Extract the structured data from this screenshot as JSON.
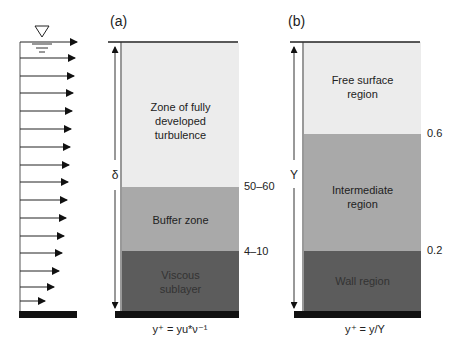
{
  "figure": {
    "velocity_profile": {
      "water_surface_symbol": "inverted-triangle",
      "arrow_count": 16
    },
    "panel_a": {
      "label": "(a)",
      "depth_symbol": "δ",
      "zones": [
        {
          "name": "Zone of fully developed turbulence",
          "lines": [
            "Zone of fully",
            "developed",
            "turbulence"
          ],
          "color": "#ececec"
        },
        {
          "name": "Buffer zone",
          "lines": [
            "Buffer zone"
          ],
          "color": "#a9a9a9"
        },
        {
          "name": "Viscous sublayer",
          "lines": [
            "Viscous",
            "sublayer"
          ],
          "color": "#5c5c5c"
        }
      ],
      "boundaries": [
        "50–60",
        "4–10"
      ],
      "formula": "y⁺ = yu*ν⁻¹"
    },
    "panel_b": {
      "label": "(b)",
      "depth_symbol": "Y",
      "zones": [
        {
          "name": "Free surface region",
          "lines": [
            "Free surface",
            "region"
          ],
          "color": "#ececec"
        },
        {
          "name": "Intermediate region",
          "lines": [
            "Intermediate",
            "region"
          ],
          "color": "#a9a9a9"
        },
        {
          "name": "Wall region",
          "lines": [
            "Wall region"
          ],
          "color": "#5c5c5c"
        }
      ],
      "boundaries": [
        "0.6",
        "0.2"
      ],
      "formula": "y⁺ = y/Y"
    }
  }
}
